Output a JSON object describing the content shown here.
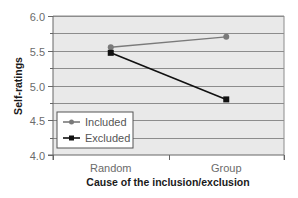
{
  "chart_data": {
    "type": "line",
    "title": "",
    "xlabel": "Cause of the inclusion/exclusion",
    "ylabel": "Self-ratings",
    "categories": [
      "Random",
      "Group"
    ],
    "series": [
      {
        "name": "Included",
        "values": [
          5.55,
          5.7
        ],
        "color": "#7a7a7a",
        "marker": "circle"
      },
      {
        "name": "Excluded",
        "values": [
          5.47,
          4.8
        ],
        "color": "#111111",
        "marker": "square"
      }
    ],
    "ylim": [
      4.0,
      6.0
    ],
    "yticks": [
      "4.0",
      "4.5",
      "5.0",
      "5.5",
      "6.0"
    ],
    "ytick_values": [
      4.0,
      4.5,
      5.0,
      5.5,
      6.0
    ],
    "minor_grid_step": 0.25,
    "grid": true,
    "legend_position": "lower left (inside plot)",
    "plot_background": "#e9e9e9",
    "gridline_color": "#8c8c8c"
  }
}
